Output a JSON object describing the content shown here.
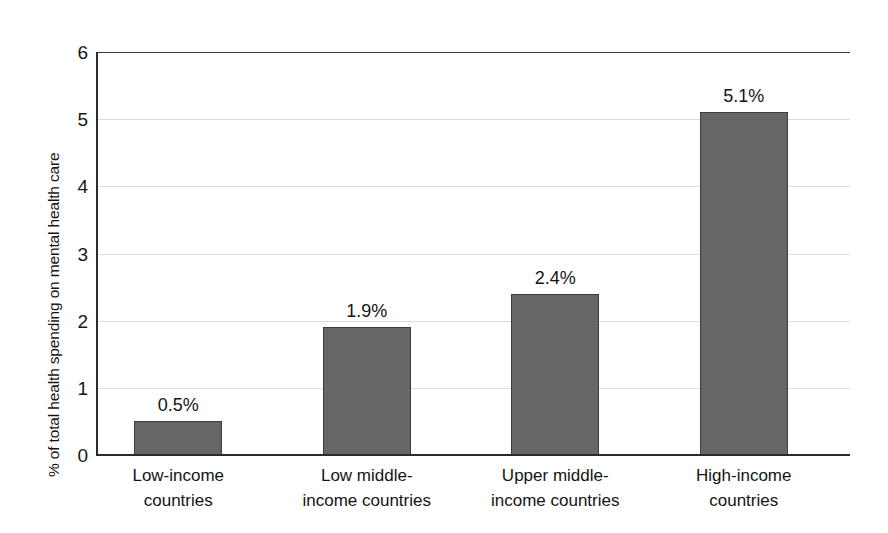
{
  "chart_data": {
    "type": "bar",
    "title": "",
    "subtitle": "",
    "xlabel": "",
    "ylabel": "% of total health spending on mental health care",
    "categories": [
      "Low-income countries",
      "Low middle-income countries",
      "Upper middle-income countries",
      "High-income countries"
    ],
    "category_lines": [
      [
        "Low-income",
        "countries"
      ],
      [
        "Low middle-",
        "income countries"
      ],
      [
        "Upper middle-",
        "income countries"
      ],
      [
        "High-income",
        "countries"
      ]
    ],
    "values": [
      0.5,
      1.9,
      2.4,
      5.1
    ],
    "data_labels": [
      "0.5%",
      "1.9%",
      "2.4%",
      "5.1%"
    ],
    "ylim": [
      0,
      6
    ],
    "ytick_labels": [
      "0",
      "1",
      "2",
      "3",
      "4",
      "5",
      "6"
    ],
    "ytick_values": [
      0,
      1,
      2,
      3,
      4,
      5,
      6
    ],
    "grid": true,
    "grid_axis": "y",
    "legend": "none",
    "bar_color": "#666666",
    "bar_edge_color": "#3d3d3d",
    "grid_color": "#dcdcdc",
    "axis_color": "#2b2b2b",
    "background_color": "#ffffff"
  }
}
